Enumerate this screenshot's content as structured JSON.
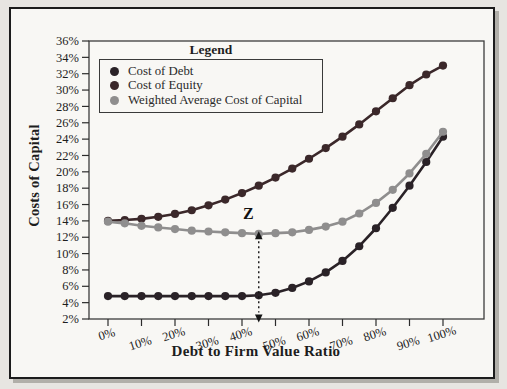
{
  "figure": {
    "y_axis_title": "Costs of Capital",
    "x_axis_title": "Debt to Firm Value Ratio",
    "legend_title": "Legend",
    "annotation_label": "Z"
  },
  "chart_data": {
    "type": "line",
    "title": "",
    "xlabel": "Debt to Firm Value Ratio",
    "ylabel": "Costs of Capital",
    "grid": false,
    "legend_position": "top-left-inside",
    "xlim": [
      0,
      100
    ],
    "ylim": [
      2,
      36
    ],
    "x": [
      0,
      5,
      10,
      15,
      20,
      25,
      30,
      35,
      40,
      45,
      50,
      55,
      60,
      65,
      70,
      75,
      80,
      85,
      90,
      95,
      100
    ],
    "x_ticks": [
      0,
      10,
      20,
      30,
      40,
      50,
      60,
      70,
      80,
      90,
      100
    ],
    "x_tick_labels": [
      "0%",
      "10%",
      "20%",
      "30%",
      "40%",
      "50%",
      "60%",
      "70%",
      "80%",
      "90%",
      "100%"
    ],
    "y_ticks": [
      36,
      34,
      32,
      30,
      28,
      26,
      24,
      22,
      20,
      18,
      16,
      14,
      12,
      10,
      8,
      6,
      4,
      2
    ],
    "y_tick_labels": [
      "36%",
      "34%",
      "32%",
      "30%",
      "28%",
      "26%",
      "24%",
      "22%",
      "20%",
      "18%",
      "16%",
      "14%",
      "12%",
      "10%",
      "8%",
      "6%",
      "4%",
      "2%"
    ],
    "series": [
      {
        "name": "Cost of Debt",
        "color": "#2a2227",
        "values": [
          4.8,
          4.8,
          4.8,
          4.8,
          4.8,
          4.8,
          4.8,
          4.8,
          4.8,
          4.9,
          5.2,
          5.8,
          6.6,
          7.7,
          9.1,
          10.9,
          13.1,
          15.6,
          18.3,
          21.2,
          24.3
        ]
      },
      {
        "name": "Cost of Equity",
        "color": "#3b282a",
        "values": [
          14.0,
          14.1,
          14.25,
          14.5,
          14.85,
          15.3,
          15.9,
          16.6,
          17.4,
          18.3,
          19.3,
          20.4,
          21.6,
          22.9,
          24.3,
          25.8,
          27.4,
          29.0,
          30.6,
          31.9,
          33.0
        ]
      },
      {
        "name": "Weighted Average Cost of Capital",
        "color": "#8f8e8e",
        "values": [
          13.9,
          13.7,
          13.4,
          13.2,
          13.0,
          12.8,
          12.7,
          12.6,
          12.5,
          12.4,
          12.5,
          12.6,
          12.9,
          13.3,
          13.9,
          14.9,
          16.2,
          17.8,
          19.8,
          22.2,
          24.9
        ]
      }
    ],
    "annotations": [
      {
        "label": "Z",
        "x": 45,
        "arrow_top_y": 12.0,
        "arrow_bottom_y": 2.3,
        "style": "vertical-dashed-double-arrow"
      }
    ]
  }
}
